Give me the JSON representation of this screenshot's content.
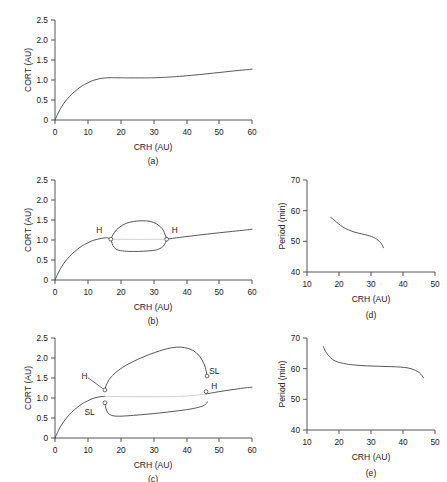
{
  "figure": {
    "name": "bifurcation-figure",
    "panels": [
      "a",
      "b",
      "c",
      "d",
      "e"
    ]
  },
  "captions": {
    "a": "(a)",
    "b": "(b)",
    "c": "(c)",
    "d": "(d)",
    "e": "(e)"
  },
  "axis_titles": {
    "crh": "CRH (AU)",
    "cort": "CORT (AU)",
    "period": "Period (min)"
  },
  "ticks": {
    "crh_full": [
      "0",
      "10",
      "20",
      "30",
      "40",
      "50",
      "60"
    ],
    "cort": [
      "0",
      "0.5",
      "1.0",
      "1.5",
      "2.0",
      "2.5"
    ],
    "crh_period": [
      "10",
      "20",
      "30",
      "40",
      "50"
    ],
    "period": [
      "40",
      "50",
      "60",
      "70"
    ]
  },
  "labels": {
    "hopf": "H",
    "saddle_loop": "SL"
  },
  "colors": {
    "stable_branch": "#3a3a3a",
    "unstable_branch": "#c9c9c9",
    "axis": "#444444",
    "text": "#1a1a1a",
    "background": "#ffffff"
  },
  "chart_data": [
    {
      "type": "line",
      "panel": "a",
      "title": "(a)",
      "xlabel": "CRH (AU)",
      "ylabel": "CORT (AU)",
      "xlim": [
        0,
        60
      ],
      "ylim": [
        0,
        2.5
      ],
      "xticks": [
        0,
        10,
        20,
        30,
        40,
        50,
        60
      ],
      "yticks": [
        0,
        0.5,
        1.0,
        1.5,
        2.0,
        2.5
      ],
      "grid": false,
      "legend": "none",
      "series": [
        {
          "name": "steady-state CORT",
          "style": "stable",
          "x": [
            0,
            1,
            2,
            3,
            4,
            5,
            6,
            7,
            8,
            9,
            10,
            11,
            12,
            13,
            14,
            15,
            16,
            17,
            18,
            20,
            22,
            25,
            28,
            30,
            33,
            36,
            40,
            44,
            48,
            52,
            56,
            60
          ],
          "y": [
            0.0,
            0.18,
            0.33,
            0.45,
            0.55,
            0.64,
            0.71,
            0.78,
            0.84,
            0.89,
            0.93,
            0.97,
            1.0,
            1.02,
            1.04,
            1.05,
            1.055,
            1.057,
            1.057,
            1.055,
            1.053,
            1.052,
            1.053,
            1.056,
            1.065,
            1.08,
            1.105,
            1.135,
            1.17,
            1.205,
            1.24,
            1.27
          ]
        }
      ]
    },
    {
      "type": "line",
      "panel": "b",
      "title": "(b)",
      "xlabel": "CRH (AU)",
      "ylabel": "CORT (AU)",
      "xlim": [
        0,
        60
      ],
      "ylim": [
        0,
        2.5
      ],
      "xticks": [
        0,
        10,
        20,
        30,
        40,
        50,
        60
      ],
      "yticks": [
        0,
        0.5,
        1.0,
        1.5,
        2.0,
        2.5
      ],
      "grid": false,
      "legend": "none",
      "annotations": [
        {
          "label": "H",
          "x": 17.0,
          "y": 1.02,
          "text_x": 13.5,
          "text_y": 1.25
        },
        {
          "label": "H",
          "x": 34.0,
          "y": 1.02,
          "text_x": 36.5,
          "text_y": 1.25
        }
      ],
      "series": [
        {
          "name": "steady-state stable (low CRH)",
          "style": "stable",
          "x": [
            0,
            1,
            2,
            3,
            4,
            5,
            6,
            7,
            8,
            9,
            10,
            11,
            12,
            13,
            14,
            15,
            16,
            17
          ],
          "y": [
            0.0,
            0.18,
            0.33,
            0.45,
            0.55,
            0.64,
            0.71,
            0.78,
            0.84,
            0.89,
            0.93,
            0.97,
            1.0,
            1.02,
            1.04,
            1.05,
            1.055,
            1.02
          ]
        },
        {
          "name": "steady-state unstable (between Hopf points)",
          "style": "unstable",
          "x": [
            17,
            20,
            23,
            26,
            29,
            31,
            34
          ],
          "y": [
            1.02,
            1.018,
            1.016,
            1.015,
            1.016,
            1.018,
            1.02
          ]
        },
        {
          "name": "steady-state stable (high CRH)",
          "style": "stable",
          "x": [
            34,
            38,
            42,
            46,
            50,
            54,
            58,
            60
          ],
          "y": [
            1.02,
            1.065,
            1.105,
            1.145,
            1.18,
            1.215,
            1.25,
            1.27
          ]
        },
        {
          "name": "limit cycle maximum",
          "style": "stable",
          "x": [
            17,
            18,
            19.5,
            21.5,
            24,
            26.5,
            29,
            31,
            32.7,
            33.6,
            34
          ],
          "y": [
            1.02,
            1.18,
            1.31,
            1.41,
            1.465,
            1.48,
            1.465,
            1.4,
            1.28,
            1.12,
            1.02
          ]
        },
        {
          "name": "limit cycle minimum",
          "style": "stable",
          "x": [
            17,
            17.6,
            18.5,
            20,
            22.5,
            25.5,
            28.5,
            31,
            32.8,
            33.7,
            34
          ],
          "y": [
            1.02,
            0.87,
            0.775,
            0.735,
            0.715,
            0.715,
            0.728,
            0.755,
            0.83,
            0.94,
            1.02
          ]
        }
      ]
    },
    {
      "type": "line",
      "panel": "c",
      "title": "(c)",
      "xlabel": "CRH (AU)",
      "ylabel": "CORT (AU)",
      "xlim": [
        0,
        60
      ],
      "ylim": [
        0,
        2.5
      ],
      "xticks": [
        0,
        10,
        20,
        30,
        40,
        50,
        60
      ],
      "yticks": [
        0,
        0.5,
        1.0,
        1.5,
        2.0,
        2.5
      ],
      "grid": false,
      "legend": "none",
      "annotations": [
        {
          "label": "H",
          "x": 15.2,
          "y": 1.2,
          "text_x": 9.0,
          "text_y": 1.55,
          "leader": true
        },
        {
          "label": "SL",
          "x": 15.2,
          "y": 0.88,
          "text_x": 10.5,
          "text_y": 0.66,
          "leader": false
        },
        {
          "label": "SL",
          "x": 46.3,
          "y": 1.55,
          "text_x": 48.5,
          "text_y": 1.68,
          "leader": false
        },
        {
          "label": "H",
          "x": 46.0,
          "y": 1.16,
          "text_x": 48.5,
          "text_y": 1.3,
          "leader": false
        }
      ],
      "series": [
        {
          "name": "steady-state stable (low CRH)",
          "style": "stable",
          "x": [
            0,
            1,
            2,
            3,
            4,
            5,
            6,
            7,
            8,
            9,
            10,
            11,
            12,
            13,
            14,
            15.2
          ],
          "y": [
            0.0,
            0.18,
            0.33,
            0.45,
            0.55,
            0.64,
            0.71,
            0.78,
            0.84,
            0.89,
            0.93,
            0.97,
            1.0,
            1.02,
            1.035,
            1.04
          ]
        },
        {
          "name": "steady-state unstable (between Hopf points)",
          "style": "unstable",
          "x": [
            15.2,
            20,
            25,
            30,
            35,
            40,
            44,
            46.0
          ],
          "y": [
            1.04,
            1.035,
            1.032,
            1.032,
            1.036,
            1.05,
            1.08,
            1.1
          ]
        },
        {
          "name": "steady-state stable (high CRH)",
          "style": "stable",
          "x": [
            46.0,
            49,
            52,
            55,
            58,
            60
          ],
          "y": [
            1.1,
            1.145,
            1.185,
            1.22,
            1.255,
            1.27
          ]
        },
        {
          "name": "limit cycle maximum",
          "style": "stable",
          "x": [
            15.2,
            15.6,
            16.5,
            18,
            20.5,
            23.5,
            27,
            30.5,
            34,
            37,
            39.5,
            42,
            44,
            45.4,
            46.1,
            46.3
          ],
          "y": [
            1.2,
            1.32,
            1.46,
            1.6,
            1.76,
            1.9,
            2.03,
            2.14,
            2.23,
            2.27,
            2.26,
            2.19,
            2.05,
            1.85,
            1.66,
            1.55
          ]
        },
        {
          "name": "limit cycle minimum",
          "style": "stable",
          "x": [
            15.2,
            15.5,
            16.2,
            17.3,
            19,
            22,
            26,
            30,
            34,
            38,
            42,
            45,
            46.2,
            46.4
          ],
          "y": [
            0.88,
            0.74,
            0.62,
            0.565,
            0.545,
            0.555,
            0.58,
            0.61,
            0.645,
            0.685,
            0.735,
            0.8,
            0.87,
            0.9
          ]
        }
      ]
    },
    {
      "type": "line",
      "panel": "d",
      "title": "(d)",
      "xlabel": "CRH (AU)",
      "ylabel": "Period (min)",
      "xlim": [
        10,
        50
      ],
      "ylim": [
        40,
        70
      ],
      "xticks": [
        10,
        20,
        30,
        40,
        50
      ],
      "yticks": [
        40,
        50,
        60,
        70
      ],
      "grid": false,
      "legend": "none",
      "series": [
        {
          "name": "oscillation period",
          "style": "stable",
          "x": [
            17.4,
            18.2,
            19.3,
            20.5,
            22,
            24,
            26,
            28,
            29.5,
            30.8,
            31.8,
            32.6,
            33.2,
            33.6,
            33.9
          ],
          "y": [
            57.8,
            57.2,
            56.2,
            55.2,
            54.2,
            53.3,
            52.7,
            52.2,
            51.8,
            51.3,
            50.7,
            50.0,
            49.3,
            48.6,
            47.9
          ]
        }
      ]
    },
    {
      "type": "line",
      "panel": "e",
      "title": "(e)",
      "xlabel": "CRH (AU)",
      "ylabel": "Period (min)",
      "xlim": [
        10,
        50
      ],
      "ylim": [
        40,
        70
      ],
      "xticks": [
        10,
        20,
        30,
        40,
        50
      ],
      "yticks": [
        40,
        50,
        60,
        70
      ],
      "grid": false,
      "legend": "none",
      "series": [
        {
          "name": "oscillation period",
          "style": "stable",
          "x": [
            15.1,
            15.8,
            16.8,
            18.0,
            19.5,
            21.0,
            23.0,
            26.0,
            29.0,
            32.0,
            35.0,
            38.0,
            40.5,
            42.5,
            44.0,
            45.2,
            45.9,
            46.4
          ],
          "y": [
            67.2,
            65.6,
            64.2,
            63.0,
            62.2,
            61.8,
            61.4,
            61.1,
            60.9,
            60.8,
            60.7,
            60.6,
            60.4,
            60.0,
            59.4,
            58.6,
            57.8,
            57.0
          ]
        }
      ]
    }
  ]
}
